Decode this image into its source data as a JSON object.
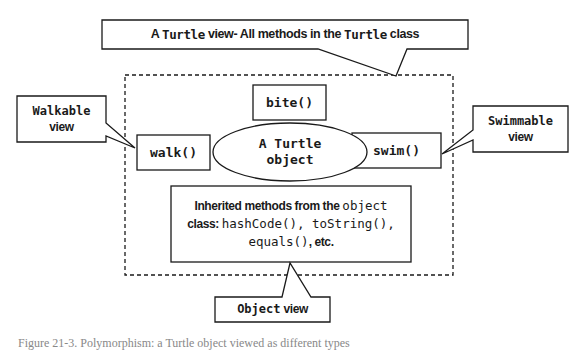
{
  "diagram": {
    "title_callout": {
      "prefix": "A ",
      "code1": "Turtle",
      "middle": " view- All methods in the ",
      "code2": "Turtle",
      "suffix": " class"
    },
    "center_object": {
      "line1": "A Turtle",
      "line2": "object"
    },
    "methods": {
      "bite": "bite()",
      "walk": "walk()",
      "swim": "swim()"
    },
    "inherited": {
      "line1_text": "Inherited methods from the ",
      "line1_code": "object",
      "line2_text": "class: ",
      "line2_code": "hashCode(), toString(),",
      "line3_code": "equals()",
      "line3_text": ", etc."
    },
    "walkable_callout": {
      "line1": "Walkable",
      "line2": "view"
    },
    "swimmable_callout": {
      "line1": "Swimmable",
      "line2": "view"
    },
    "object_callout": {
      "code": "Object",
      "text": " view"
    },
    "caption": "Figure 21-3. Polymorphism: a Turtle object viewed as different types"
  },
  "colors": {
    "stroke": "#1a1a1a",
    "background": "#ffffff"
  }
}
